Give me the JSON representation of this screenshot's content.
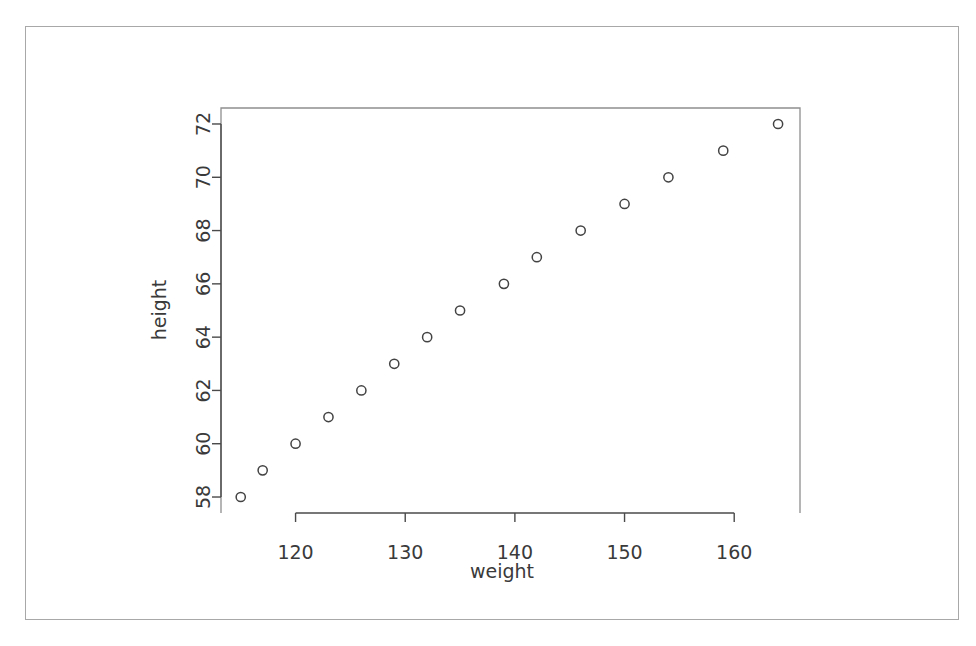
{
  "figure": {
    "frame_color": "#a8a8a8",
    "background": "#ffffff",
    "axis_color": "#4a4a4a",
    "point_color": "#434343"
  },
  "chart_data": {
    "type": "scatter",
    "title": "",
    "subtitle": "",
    "xlabel": "weight",
    "ylabel": "height",
    "grid": false,
    "legend": false,
    "legend_position": "none",
    "marker": "open-circle",
    "xlim": [
      113.2,
      166.0
    ],
    "ylim": [
      57.4,
      72.6
    ],
    "xticks": [
      120,
      130,
      140,
      150,
      160
    ],
    "xtick_labels": [
      "120",
      "130",
      "140",
      "150",
      "160"
    ],
    "yticks": [
      58,
      60,
      62,
      64,
      66,
      68,
      70,
      72
    ],
    "ytick_labels": [
      "58",
      "60",
      "62",
      "64",
      "66",
      "68",
      "70",
      "72"
    ],
    "series": [
      {
        "name": "women",
        "x": [
          115,
          117,
          120,
          123,
          126,
          129,
          132,
          135,
          139,
          142,
          146,
          150,
          154,
          159,
          164
        ],
        "y": [
          58,
          59,
          60,
          61,
          62,
          63,
          64,
          65,
          66,
          67,
          68,
          69,
          70,
          71,
          72
        ]
      }
    ],
    "points": [
      {
        "x": 115,
        "y": 58
      },
      {
        "x": 117,
        "y": 59
      },
      {
        "x": 120,
        "y": 60
      },
      {
        "x": 123,
        "y": 61
      },
      {
        "x": 126,
        "y": 62
      },
      {
        "x": 129,
        "y": 63
      },
      {
        "x": 132,
        "y": 64
      },
      {
        "x": 135,
        "y": 65
      },
      {
        "x": 139,
        "y": 66
      },
      {
        "x": 142,
        "y": 67
      },
      {
        "x": 146,
        "y": 68
      },
      {
        "x": 150,
        "y": 69
      },
      {
        "x": 154,
        "y": 70
      },
      {
        "x": 159,
        "y": 71
      },
      {
        "x": 164,
        "y": 72
      }
    ]
  }
}
